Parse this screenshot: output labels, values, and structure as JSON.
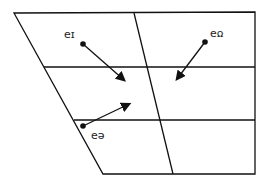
{
  "diagram": {
    "type": "vowel-quadrilateral",
    "colors": {
      "line": "#111111",
      "background": "#ffffff"
    },
    "diphthongs": [
      {
        "label": "ɪə",
        "label_pos": [
          66,
          31
        ]
      },
      {
        "label": "ʊə",
        "label_pos": [
          211,
          30
        ]
      },
      {
        "label": "eə",
        "label_pos": [
          90,
          130
        ]
      }
    ]
  }
}
